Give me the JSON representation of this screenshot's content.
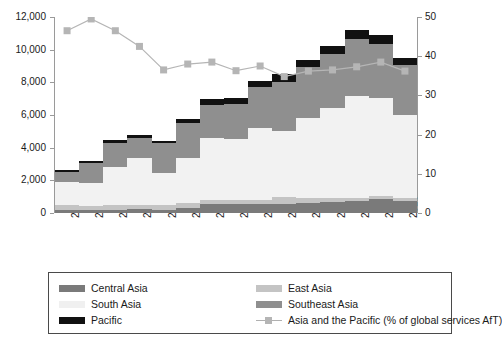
{
  "chart_data": {
    "type": "bar",
    "title": "",
    "subtitle": "",
    "xlabel": "",
    "ylabel": "",
    "grid": false,
    "legend_position": "bottom",
    "categories": [
      "2002",
      "2003",
      "2004",
      "2005",
      "2006",
      "2007",
      "2008",
      "2009",
      "2010",
      "2011",
      "2012",
      "2013",
      "2014",
      "2015",
      "2016"
    ],
    "axes": {
      "left": {
        "label": "",
        "lim": [
          0,
          12000
        ],
        "ticks": [
          0,
          2000,
          4000,
          6000,
          8000,
          10000,
          12000
        ],
        "ticklabels": [
          "0",
          "2,000",
          "4,000",
          "6,000",
          "8,000",
          "10,000",
          "12,000"
        ]
      },
      "right": {
        "label": "",
        "lim": [
          0,
          50
        ],
        "ticks": [
          0,
          10,
          20,
          30,
          40,
          50
        ],
        "ticklabels": [
          "0",
          "10",
          "20",
          "30",
          "40",
          "50"
        ]
      }
    },
    "series": [
      {
        "name": "Central Asia",
        "key": "central",
        "kind": "bar",
        "color": "#7a7a7a",
        "axis": "left",
        "values": [
          180,
          200,
          210,
          230,
          210,
          330,
          560,
          540,
          560,
          580,
          620,
          700,
          740,
          840,
          730
        ]
      },
      {
        "name": "East Asia",
        "key": "east",
        "kind": "bar",
        "color": "#c4c4c4",
        "axis": "left",
        "values": [
          330,
          250,
          290,
          280,
          260,
          280,
          220,
          230,
          240,
          420,
          280,
          200,
          170,
          180,
          180
        ]
      },
      {
        "name": "South Asia",
        "key": "south",
        "kind": "bar",
        "color": "#f2f2f2",
        "axis": "left",
        "values": [
          1380,
          1400,
          2300,
          2870,
          1980,
          2770,
          3840,
          3760,
          4420,
          4050,
          4900,
          5500,
          6270,
          6050,
          5120
        ]
      },
      {
        "name": "Southeast Asia",
        "key": "southeast",
        "kind": "bar",
        "color": "#8f8f8f",
        "axis": "left",
        "values": [
          620,
          1230,
          1480,
          1190,
          1820,
          2130,
          2020,
          2170,
          2470,
          2960,
          3150,
          3320,
          3480,
          3250,
          3020
        ]
      },
      {
        "name": "Pacific",
        "key": "pacific",
        "kind": "bar",
        "color": "#111111",
        "axis": "left",
        "values": [
          110,
          120,
          170,
          190,
          150,
          250,
          360,
          360,
          410,
          490,
          450,
          480,
          540,
          580,
          450
        ]
      },
      {
        "name": "Asia and the Pacific (% of global services AfT)",
        "key": "share",
        "kind": "line",
        "color": "#b5b5b5",
        "axis": "right",
        "values": [
          46.5,
          49.5,
          46.5,
          42.5,
          36.5,
          38.0,
          38.5,
          36.3,
          37.5,
          34.8,
          36.2,
          36.5,
          37.3,
          38.5,
          36.2
        ]
      }
    ],
    "totals": [
      2620,
      3200,
      4450,
      4760,
      4420,
      5760,
      7000,
      7060,
      8100,
      8500,
      9400,
      10200,
      11200,
      10900,
      9500
    ]
  },
  "legend": {
    "items": [
      {
        "label": "Central Asia",
        "swatch": "swatch-central"
      },
      {
        "label": "East Asia",
        "swatch": "swatch-east"
      },
      {
        "label": "South Asia",
        "swatch": "swatch-south"
      },
      {
        "label": "Southeast Asia",
        "swatch": "swatch-southeast"
      },
      {
        "label": "Pacific",
        "swatch": "swatch-pacific"
      },
      {
        "label": "Asia and the Pacific (% of global services AfT)",
        "swatch": "line-marker-swatch"
      }
    ]
  }
}
